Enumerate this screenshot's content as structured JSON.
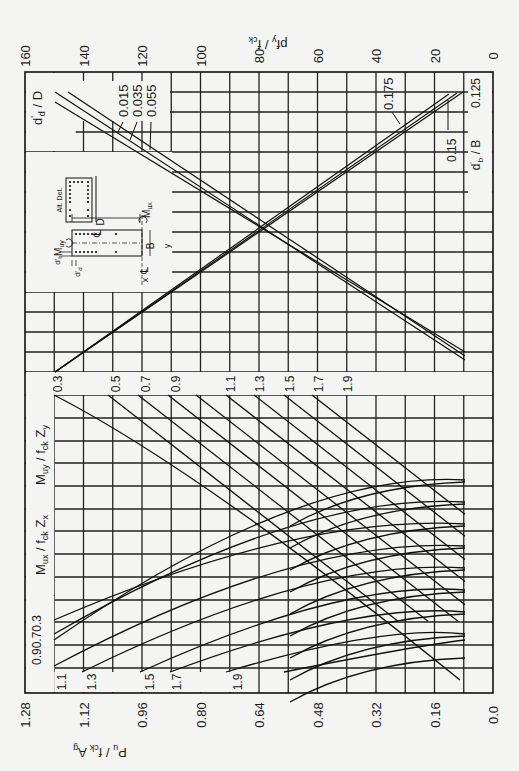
{
  "chart_data": {
    "type": "line",
    "orientation": "rotated-90-ccw",
    "top_axis": {
      "label_main": "pf",
      "label_sub1": "y",
      "label_sep": " / f",
      "label_sub2": "ck",
      "ticks": [
        160,
        140,
        120,
        100,
        80,
        60,
        40,
        20,
        0
      ],
      "range": [
        160,
        0
      ]
    },
    "bottom_axis": {
      "label_main": "P",
      "label_sub1": "u",
      "label_sep": " / f",
      "label_sub2": "ck",
      "label_end": " A",
      "label_sub3": "g",
      "ticks": [
        "1.28",
        "1.12",
        "0.96",
        "0.80",
        "0.64",
        "0.48",
        "0.32",
        "0.16",
        "0.0"
      ],
      "range": [
        1.28,
        0.0
      ]
    },
    "ratio_labels": {
      "dd_over_D": {
        "main": "d",
        "sup": "'",
        "sub": "d",
        "sep": " / D"
      },
      "db_over_B": {
        "main": "d",
        "sup": "'",
        "sub": "b",
        "sep": " / B"
      }
    },
    "dd_D_series": [
      {
        "name": "0.015",
        "top_x": 25,
        "slope_note": "steepest"
      },
      {
        "name": "0.035"
      },
      {
        "name": "0.055"
      }
    ],
    "db_B_series": [
      {
        "name": "0.125"
      },
      {
        "name": "0.15"
      },
      {
        "name": "0.175"
      }
    ],
    "muy_panel": {
      "label": {
        "main": "M",
        "sub1": "uy",
        "sep": " / f",
        "sub2": "ck",
        "end": " Z",
        "sub3": "y"
      },
      "values": [
        "0.3",
        "0.5",
        "0.7",
        "0.9",
        "1.1",
        "1.3",
        "1.5",
        "1.7",
        "1.9"
      ]
    },
    "mux_panel": {
      "label": {
        "main": "M",
        "sub1": "ux",
        "sep": " / f",
        "sub2": "ck",
        "end": " Z",
        "sub3": "x"
      },
      "values": [
        "0.9",
        "0.7",
        "0.3",
        "1.1",
        "1.3",
        "1.5",
        "1.7",
        "1.9"
      ],
      "stacked_label": "0.90.70.3"
    },
    "section_sketch": {
      "labels": {
        "alt_det": "Alt. Det.",
        "mux": "M",
        "mux_sub": "ux",
        "muy": "M",
        "muy_sub": "uy",
        "D": "D",
        "B": "B",
        "x": "x",
        "y": "y",
        "cl": "℄",
        "db": "d'",
        "db_sub": "b",
        "dd": "d'",
        "dd_sub": "d"
      }
    },
    "grid": true,
    "legend_position": "none"
  },
  "colors": {
    "paper": "#f4f4f2",
    "ink": "#111111"
  }
}
